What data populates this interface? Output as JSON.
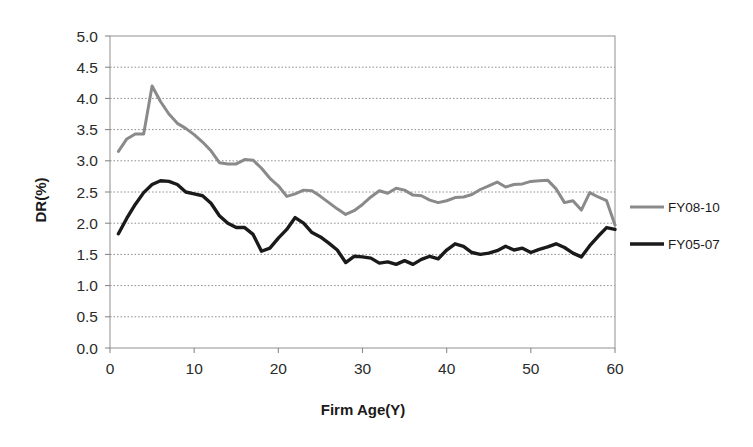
{
  "chart_data": {
    "type": "line",
    "title": "",
    "xlabel": "Firm Age(Y)",
    "ylabel": "DR(%)",
    "xlim": [
      0,
      60
    ],
    "ylim": [
      0.0,
      5.0
    ],
    "xticks": [
      "0",
      "10",
      "20",
      "30",
      "40",
      "50",
      "60"
    ],
    "xtick_values": [
      0,
      10,
      20,
      30,
      40,
      50,
      60
    ],
    "yticks": [
      "0.0",
      "0.5",
      "1.0",
      "1.5",
      "2.0",
      "2.5",
      "3.0",
      "3.5",
      "4.0",
      "4.5",
      "5.0"
    ],
    "ytick_values": [
      0.0,
      0.5,
      1.0,
      1.5,
      2.0,
      2.5,
      3.0,
      3.5,
      4.0,
      4.5,
      5.0
    ],
    "grid": true,
    "grid_axis": "y",
    "grid_style": "dotted",
    "legend_position": "right",
    "x": [
      1,
      2,
      3,
      4,
      5,
      6,
      7,
      8,
      9,
      10,
      11,
      12,
      13,
      14,
      15,
      16,
      17,
      18,
      19,
      20,
      21,
      22,
      23,
      24,
      25,
      26,
      27,
      28,
      29,
      30,
      31,
      32,
      33,
      34,
      35,
      36,
      37,
      38,
      39,
      40,
      41,
      42,
      43,
      44,
      45,
      46,
      47,
      48,
      49,
      50,
      51,
      52,
      53,
      54,
      55,
      56,
      57,
      58,
      59,
      60
    ],
    "series": [
      {
        "name": "FY08-10",
        "color": "#8a8a8a",
        "width": 3.0,
        "values": [
          3.15,
          3.35,
          3.43,
          3.43,
          4.2,
          3.95,
          3.75,
          3.6,
          3.52,
          3.42,
          3.3,
          3.16,
          2.97,
          2.95,
          2.95,
          3.02,
          3.01,
          2.88,
          2.72,
          2.6,
          2.43,
          2.47,
          2.53,
          2.52,
          2.43,
          2.33,
          2.23,
          2.14,
          2.2,
          2.3,
          2.42,
          2.52,
          2.48,
          2.56,
          2.53,
          2.45,
          2.44,
          2.37,
          2.33,
          2.36,
          2.41,
          2.42,
          2.46,
          2.54,
          2.6,
          2.66,
          2.58,
          2.62,
          2.63,
          2.67,
          2.68,
          2.69,
          2.55,
          2.33,
          2.36,
          2.21,
          2.49,
          2.42,
          2.36,
          1.97
        ]
      },
      {
        "name": "FY05-07",
        "color": "#1a1a1a",
        "width": 3.4,
        "values": [
          1.83,
          2.08,
          2.3,
          2.49,
          2.62,
          2.68,
          2.67,
          2.62,
          2.5,
          2.47,
          2.44,
          2.32,
          2.12,
          2.0,
          1.93,
          1.93,
          1.82,
          1.55,
          1.6,
          1.76,
          1.9,
          2.09,
          2.0,
          1.85,
          1.78,
          1.68,
          1.57,
          1.37,
          1.47,
          1.46,
          1.44,
          1.36,
          1.38,
          1.34,
          1.4,
          1.34,
          1.42,
          1.47,
          1.43,
          1.57,
          1.67,
          1.63,
          1.53,
          1.5,
          1.52,
          1.56,
          1.63,
          1.57,
          1.6,
          1.53,
          1.58,
          1.62,
          1.67,
          1.61,
          1.52,
          1.46,
          1.64,
          1.79,
          1.93,
          1.9
        ]
      }
    ]
  },
  "legend": {
    "items": [
      {
        "label": "FY08-10",
        "color": "#8a8a8a"
      },
      {
        "label": "FY05-07",
        "color": "#1a1a1a"
      }
    ]
  },
  "axes": {
    "x_title": "Firm Age(Y)",
    "y_title": "DR(%)"
  }
}
